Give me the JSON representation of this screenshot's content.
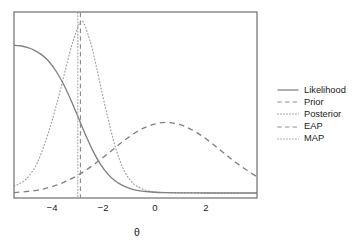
{
  "chart_data": {
    "type": "line",
    "title": "",
    "xlabel": "θ",
    "ylabel": "",
    "xlim": [
      -5.2,
      3.1
    ],
    "ylim": [
      0,
      1.06
    ],
    "grid": false,
    "legend_position": "right",
    "xticks": [
      -4,
      -2,
      0,
      2
    ],
    "xtick_labels": [
      "−4",
      "−2",
      "0",
      "2"
    ],
    "series": [
      {
        "name": "Likelihood",
        "style": "solid",
        "color": "#808080",
        "description": "Monotonically decreasing logistic-like curve from high at theta = -5.2 down to near zero past theta = -1",
        "x": [
          -5.2,
          -5.0,
          -4.75,
          -4.5,
          -4.25,
          -4.0,
          -3.75,
          -3.5,
          -3.25,
          -3.0,
          -2.75,
          -2.5,
          -2.25,
          -2.0,
          -1.75,
          -1.5,
          -1.25,
          -1.0,
          -0.5,
          0.0,
          1.0,
          2.0,
          3.1
        ],
        "y": [
          0.875,
          0.872,
          0.862,
          0.845,
          0.818,
          0.777,
          0.718,
          0.641,
          0.548,
          0.445,
          0.342,
          0.248,
          0.171,
          0.113,
          0.072,
          0.045,
          0.027,
          0.016,
          0.006,
          0.002,
          0.0005,
          0.0002,
          0.0001
        ]
      },
      {
        "name": "Prior",
        "style": "dashed",
        "color": "#808080",
        "description": "Broad normal density centered at theta = 0 with sd about 1.35",
        "x": [
          -5.2,
          -4.5,
          -4.0,
          -3.5,
          -3.0,
          -2.5,
          -2.0,
          -1.5,
          -1.0,
          -0.5,
          0.0,
          0.5,
          1.0,
          1.5,
          2.0,
          2.5,
          3.1
        ],
        "y": [
          0.002,
          0.014,
          0.033,
          0.063,
          0.107,
          0.165,
          0.232,
          0.302,
          0.363,
          0.403,
          0.418,
          0.403,
          0.363,
          0.302,
          0.232,
          0.165,
          0.095
        ]
      },
      {
        "name": "Posterior",
        "style": "dotted",
        "color": "#9c9c9c",
        "description": "Sharp unimodal density peaking near theta = -2.9, truncated at the top of the plotting frame",
        "x": [
          -5.2,
          -4.8,
          -4.4,
          -4.0,
          -3.8,
          -3.6,
          -3.4,
          -3.2,
          -3.0,
          -2.9,
          -2.8,
          -2.6,
          -2.4,
          -2.2,
          -2.0,
          -1.8,
          -1.6,
          -1.4,
          -1.2,
          -1.0,
          -0.6,
          0.0,
          1.0,
          3.1
        ],
        "y": [
          0.04,
          0.08,
          0.18,
          0.37,
          0.49,
          0.62,
          0.76,
          0.89,
          0.99,
          1.02,
          1.0,
          0.9,
          0.76,
          0.6,
          0.45,
          0.31,
          0.2,
          0.12,
          0.07,
          0.04,
          0.012,
          0.002,
          0.0005,
          0.0
        ]
      },
      {
        "name": "EAP",
        "style": "dashed-vertical",
        "color": "#8c8c8c",
        "description": "Vertical reference line marking the expected a posteriori estimate",
        "x": -2.93
      },
      {
        "name": "MAP",
        "style": "dotted-vertical",
        "color": "#a8a8a8",
        "description": "Vertical reference line marking the maximum a posteriori estimate",
        "x": -3.02
      }
    ]
  },
  "axis": {
    "x_title": "θ",
    "ticks": [
      {
        "label": "−4",
        "value": -4
      },
      {
        "label": "−2",
        "value": -2
      },
      {
        "label": "0",
        "value": 0
      },
      {
        "label": "2",
        "value": 2
      }
    ]
  },
  "legend": {
    "items": [
      {
        "label": "Likelihood",
        "style": "solid",
        "color": "#808080"
      },
      {
        "label": "Prior",
        "style": "dashed",
        "color": "#808080"
      },
      {
        "label": "Posterior",
        "style": "dotted",
        "color": "#9c9c9c"
      },
      {
        "label": "EAP",
        "style": "dashed",
        "color": "#8c8c8c"
      },
      {
        "label": "MAP",
        "style": "dotted",
        "color": "#a8a8a8"
      }
    ]
  },
  "colors": {
    "background": "#ffffff",
    "frame": "#6e6e6e",
    "text": "#1a1a1a",
    "curve": "#808080"
  }
}
